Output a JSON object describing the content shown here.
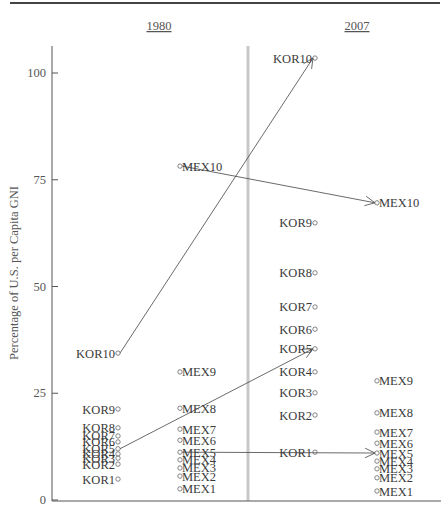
{
  "chart_data": {
    "type": "scatter",
    "title": "",
    "xlabel": "",
    "ylabel": "Percentage of U.S. per Capita GNI",
    "ylim": [
      0,
      105
    ],
    "yticks": [
      0,
      25,
      50,
      75,
      100
    ],
    "grid": false,
    "panels": [
      "1980",
      "2007"
    ],
    "series": [
      {
        "name": "KOR",
        "year": "1980",
        "labels": [
          "KOR1",
          "KOR2",
          "KOR3",
          "KOR4",
          "KOR5",
          "KOR6",
          "KOR7",
          "KOR8",
          "KOR9",
          "KOR10"
        ],
        "values": [
          4.9,
          8.4,
          9.8,
          10.8,
          12.0,
          13.6,
          15.0,
          16.9,
          21.3,
          34.4
        ]
      },
      {
        "name": "MEX",
        "year": "1980",
        "labels": [
          "MEX1",
          "MEX2",
          "MEX3",
          "MEX4",
          "MEX5",
          "MEX6",
          "MEX7",
          "MEX8",
          "MEX9",
          "MEX10"
        ],
        "values": [
          2.6,
          5.6,
          7.5,
          9.4,
          11.2,
          14.0,
          16.6,
          21.5,
          30.0,
          78.2
        ]
      },
      {
        "name": "KOR",
        "year": "2007",
        "labels": [
          "KOR1",
          "KOR2",
          "KOR3",
          "KOR4",
          "KOR5",
          "KOR6",
          "KOR7",
          "KOR8",
          "KOR9",
          "KOR10"
        ],
        "values": [
          11.2,
          19.9,
          25.1,
          30.0,
          35.4,
          40.0,
          45.2,
          53.2,
          64.9,
          103.5
        ]
      },
      {
        "name": "MEX",
        "year": "2007",
        "labels": [
          "MEX1",
          "MEX2",
          "MEX3",
          "MEX4",
          "MEX5",
          "MEX6",
          "MEX7",
          "MEX8",
          "MEX9",
          "MEX10"
        ],
        "values": [
          2.1,
          5.2,
          7.3,
          9.1,
          11.0,
          13.3,
          15.9,
          20.4,
          27.9,
          69.6
        ]
      }
    ],
    "arrows": [
      {
        "from": "KOR10 1980",
        "to": "KOR10 2007"
      },
      {
        "from": "MEX10 1980",
        "to": "MEX10 2007"
      },
      {
        "from": "KOR5 1980",
        "to": "KOR5 2007"
      },
      {
        "from": "MEX5 1980",
        "to": "MEX5 2007"
      }
    ],
    "legend": null
  },
  "axis": {
    "ylabel": "Percentage of U.S. per Capita GNI",
    "ticks": [
      "0",
      "25",
      "50",
      "75",
      "100"
    ]
  },
  "panels": {
    "left_title": "1980",
    "right_title": "2007"
  }
}
